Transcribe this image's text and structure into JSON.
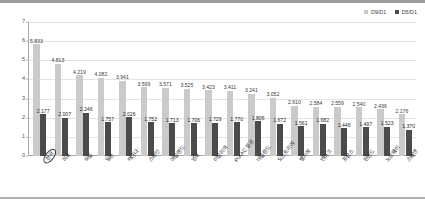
{
  "legend": {
    "position": "top-right",
    "items": [
      {
        "label": "D9/D1",
        "color": "#cacaca",
        "name": "d9d1"
      },
      {
        "label": "D5/D1",
        "color": "#4b4b4b",
        "name": "d5d1"
      }
    ]
  },
  "yaxis": {
    "ticks": [
      "0",
      "1",
      "2",
      "3",
      "4",
      "5",
      "6",
      "7"
    ],
    "min": 0,
    "max": 7
  },
  "chart_data": {
    "type": "bar",
    "title": "",
    "subtitle": "",
    "xlabel": "",
    "ylabel": "",
    "ylim": [
      0,
      7
    ],
    "grid": true,
    "legend_position": "top-right",
    "categories": [
      "한국",
      "미국",
      "독일",
      "일본",
      "캐나다",
      "스페인",
      "아일랜드",
      "영국",
      "이탈리아",
      "PIAAC 평균",
      "네덜란드",
      "오스트리아",
      "벨기에",
      "덴마크",
      "프랑스",
      "핀란드",
      "노르웨이",
      "스웨덴"
    ],
    "highlighted_category": "한국",
    "series": [
      {
        "name": "D9/D1",
        "color": "#cacaca",
        "values": [
          5.833,
          4.813,
          4.219,
          4.082,
          3.941,
          3.599,
          3.571,
          3.525,
          3.423,
          3.411,
          3.241,
          3.052,
          2.61,
          2.584,
          2.559,
          2.54,
          2.436,
          2.176
        ],
        "labels": [
          "5.833",
          "4.813",
          "4.219",
          "4.082",
          "3.941",
          "3.599",
          "3.571",
          "3.525",
          "3.423",
          "3.411",
          "3.241",
          "3.052",
          "2.610",
          "2.584",
          "2.559",
          "2.540",
          "2.436",
          "2.176"
        ]
      },
      {
        "name": "D5/D1",
        "color": "#4b4b4b",
        "values": [
          2.177,
          2.007,
          2.246,
          1.757,
          2.026,
          1.752,
          1.713,
          1.706,
          1.729,
          1.77,
          1.806,
          1.672,
          1.561,
          1.682,
          1.446,
          1.497,
          1.523,
          1.37
        ],
        "labels": [
          "2.177",
          "2.007",
          "2.246",
          "1.757",
          "2.026",
          "1.752",
          "1.713",
          "1.706",
          "1.729",
          "1.770",
          "1.806",
          "1.672",
          "1.561",
          "1.682",
          "1.446",
          "1.497",
          "1.523",
          "1.370"
        ]
      }
    ]
  }
}
